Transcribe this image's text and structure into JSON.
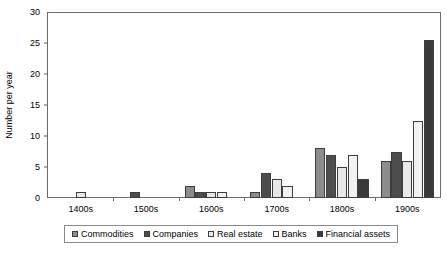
{
  "chart_data": {
    "type": "bar",
    "title": "",
    "xlabel": "",
    "ylabel": "Number per year",
    "ylim": [
      0,
      30
    ],
    "yticks": [
      0,
      5,
      10,
      15,
      20,
      25,
      30
    ],
    "grid": false,
    "legend_position": "bottom",
    "categories": [
      "1400s",
      "1500s",
      "1600s",
      "1700s",
      "1800s",
      "1900s"
    ],
    "series": [
      {
        "name": "Commodities",
        "color": "#8c8c8c",
        "values": [
          0,
          0,
          2,
          1,
          8,
          6
        ]
      },
      {
        "name": "Companies",
        "color": "#4d4d4d",
        "values": [
          0,
          1,
          1,
          4,
          7,
          7.5
        ]
      },
      {
        "name": "Real estate",
        "color": "#e8e8e8",
        "values": [
          1,
          0,
          1,
          3,
          5,
          6
        ]
      },
      {
        "name": "Banks",
        "color": "#f2f2f2",
        "values": [
          0,
          0,
          1,
          2,
          7,
          12.5
        ]
      },
      {
        "name": "Financial assets",
        "color": "#3a3a3a",
        "values": [
          0,
          0,
          0,
          0,
          3,
          25.5
        ]
      }
    ]
  },
  "axis": {
    "y_tick_labels": [
      "0",
      "5",
      "10",
      "15",
      "20",
      "25",
      "30"
    ],
    "y_axis_title": "Number per year",
    "x_tick_labels": [
      "1400s",
      "1500s",
      "1600s",
      "1700s",
      "1800s",
      "1900s"
    ]
  },
  "legend": {
    "items": [
      {
        "label": "Commodities",
        "color": "#8c8c8c"
      },
      {
        "label": "Companies",
        "color": "#4d4d4d"
      },
      {
        "label": "Real estate",
        "color": "#e8e8e8"
      },
      {
        "label": "Banks",
        "color": "#f2f2f2"
      },
      {
        "label": "Financial assets",
        "color": "#3a3a3a"
      }
    ]
  }
}
